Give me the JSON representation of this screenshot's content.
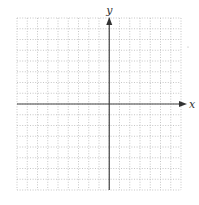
{
  "diagram": {
    "type": "coordinate-plane",
    "grid": {
      "columns": 16,
      "rows": 16,
      "left": 17,
      "top": 18,
      "right": 181,
      "bottom": 190,
      "line_style": "dotted",
      "line_color": "#b8b8b8"
    },
    "axes": {
      "color": "#444444",
      "x_axis": {
        "label": "x",
        "row_index": 8,
        "arrow": "right"
      },
      "y_axis": {
        "label": "y",
        "column_index": 9,
        "arrow": "up"
      }
    }
  }
}
